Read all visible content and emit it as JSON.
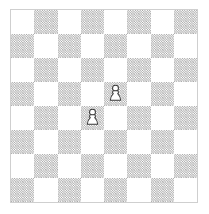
{
  "app": {
    "title": "Chess Board",
    "canvas_width": 209,
    "canvas_height": 214
  },
  "board": {
    "files": [
      "a",
      "b",
      "c",
      "d",
      "e",
      "f",
      "g",
      "h"
    ],
    "ranks": [
      "8",
      "7",
      "6",
      "5",
      "4",
      "3",
      "2",
      "1"
    ],
    "rows": 8,
    "columns": 8,
    "orientation": "white-bottom",
    "top_left_square_color": "light",
    "square_size_px": 23.25,
    "border_color": "#cfcfcf",
    "light_square_color": "#ffffff",
    "dark_square_color": "#cccccc",
    "dark_square_fill_style": "hatched-dither",
    "piece_outline_color": "#3a3a3a",
    "piece_fill_color": "#ffffff",
    "squares": [
      [
        "light",
        "dark",
        "light",
        "dark",
        "light",
        "dark",
        "light",
        "dark"
      ],
      [
        "dark",
        "light",
        "dark",
        "light",
        "dark",
        "light",
        "dark",
        "light"
      ],
      [
        "light",
        "dark",
        "light",
        "dark",
        "light",
        "dark",
        "light",
        "dark"
      ],
      [
        "dark",
        "light",
        "dark",
        "light",
        "dark",
        "light",
        "dark",
        "light"
      ],
      [
        "light",
        "dark",
        "light",
        "dark",
        "light",
        "dark",
        "light",
        "dark"
      ],
      [
        "dark",
        "light",
        "dark",
        "light",
        "dark",
        "light",
        "dark",
        "light"
      ],
      [
        "light",
        "dark",
        "light",
        "dark",
        "light",
        "dark",
        "light",
        "dark"
      ],
      [
        "dark",
        "light",
        "dark",
        "light",
        "dark",
        "light",
        "dark",
        "light"
      ]
    ]
  },
  "pieces": [
    {
      "id": "white-pawn-e5",
      "type": "pawn",
      "color": "white",
      "square": "e5",
      "file": "e",
      "rank": "5",
      "column_index": 4,
      "row_index": 3,
      "symbol": "♙"
    },
    {
      "id": "white-pawn-d4",
      "type": "pawn",
      "color": "white",
      "square": "d4",
      "file": "d",
      "rank": "4",
      "column_index": 3,
      "row_index": 4,
      "symbol": "♙"
    }
  ],
  "position": {
    "fen": "8/8/8/4P3/3P4/8/8/8 w - - 0 1",
    "white_piece_count": 2,
    "black_piece_count": 0
  }
}
